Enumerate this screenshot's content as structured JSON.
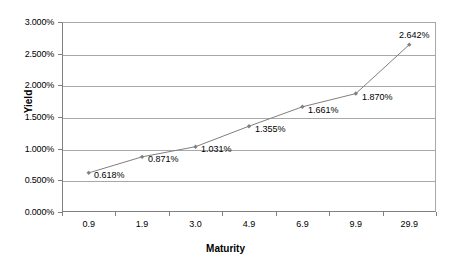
{
  "chart_data": {
    "type": "line",
    "title": "",
    "xlabel": "Maturity",
    "ylabel": "Yield",
    "categories": [
      "0.9",
      "1.9",
      "3.0",
      "4.9",
      "6.9",
      "9.9",
      "29.9"
    ],
    "values": [
      0.618,
      0.871,
      1.031,
      1.355,
      1.661,
      1.87,
      2.642
    ],
    "point_labels": [
      "0.618%",
      "0.871%",
      "1.031%",
      "1.355%",
      "1.661%",
      "1.870%",
      "2.642%"
    ],
    "ylim": [
      0,
      3
    ],
    "ytick_labels": [
      "0.000%",
      "0.500%",
      "1.000%",
      "1.500%",
      "2.000%",
      "2.500%",
      "3.000%"
    ],
    "ytick_values": [
      0,
      0.5,
      1.0,
      1.5,
      2.0,
      2.5,
      3.0
    ],
    "grid": true,
    "legend": "none",
    "series_color": "#808080",
    "grid_color": "#a8a8a8",
    "axis_color": "#808080"
  }
}
